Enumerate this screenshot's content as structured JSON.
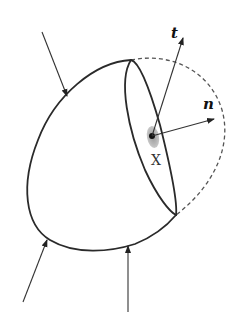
{
  "figure": {
    "labels": {
      "tangent": "t",
      "normal": "n",
      "point": "X"
    },
    "colors": {
      "outline": "#2a2a2a",
      "dashed": "#555555",
      "blob": "#b0b0b0",
      "point": "#111111"
    },
    "external_force_arrows": 3
  }
}
